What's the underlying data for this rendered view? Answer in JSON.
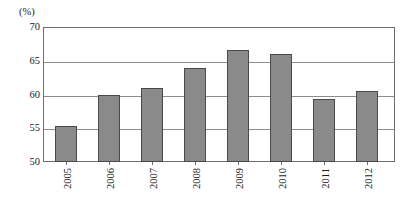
{
  "chart_data": {
    "type": "bar",
    "title": "",
    "subtitle": "",
    "xlabel": "",
    "ylabel": "(%)",
    "unit_label": "(%)",
    "categories": [
      "2005",
      "2006",
      "2007",
      "2008",
      "2009",
      "2010",
      "2011",
      "2012"
    ],
    "values": [
      55.3,
      59.9,
      61.0,
      63.9,
      66.6,
      66.0,
      59.4,
      60.5
    ],
    "ylim": [
      50,
      70
    ],
    "yticks": [
      50,
      55,
      60,
      65,
      70
    ],
    "ytick_labels": [
      "50",
      "55",
      "60",
      "65",
      "70"
    ],
    "grid": true,
    "grid_axis": "y",
    "legend": false,
    "legend_position": "none",
    "series": [
      {
        "name": "",
        "values": [
          55.3,
          59.9,
          61.0,
          63.9,
          66.6,
          66.0,
          59.4,
          60.5
        ]
      }
    ],
    "colors": {
      "bar_fill": "#8a8a8a",
      "bar_border": "#4a4a4a",
      "gridline": "#8d8d8d",
      "frame": "#6f6f6f",
      "background": "#ffffff",
      "text": "#1a1a1a"
    }
  }
}
